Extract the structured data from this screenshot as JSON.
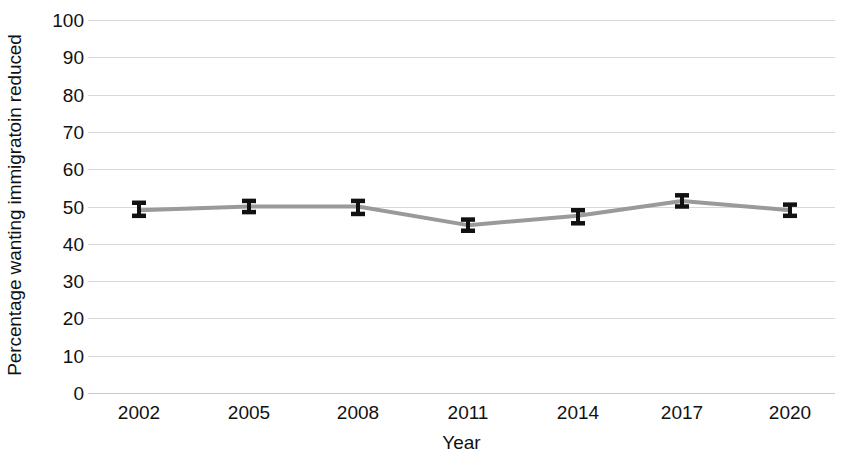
{
  "chart_data": {
    "type": "line",
    "title": "",
    "xlabel": "Year",
    "ylabel": "Percentage wanting immigratoin reduced",
    "categories": [
      "2002",
      "2005",
      "2008",
      "2011",
      "2014",
      "2017",
      "2020"
    ],
    "x": [
      2002,
      2005,
      2008,
      2011,
      2014,
      2017,
      2020
    ],
    "values": [
      49,
      50,
      50,
      45,
      47.5,
      51.5,
      49
    ],
    "errors_low": [
      47.5,
      48.5,
      48,
      43.5,
      45.5,
      50,
      47.5
    ],
    "errors_high": [
      51,
      51.5,
      51.5,
      46.5,
      49,
      53,
      50.5
    ],
    "ylim": [
      0,
      100
    ],
    "ytick_labels": [
      "100",
      "90",
      "80",
      "70",
      "60",
      "50",
      "40",
      "30",
      "20",
      "10",
      "0"
    ],
    "ytick_values": [
      100,
      90,
      80,
      70,
      60,
      50,
      40,
      30,
      20,
      10,
      0
    ],
    "grid": true,
    "legend": "none",
    "series": [
      {
        "name": "Percentage wanting immigration reduced",
        "values": [
          49,
          50,
          50,
          45,
          47.5,
          51.5,
          49
        ],
        "line_color": "#9a9a9a",
        "marker_color": "#111111"
      }
    ]
  },
  "colors": {
    "line": "#9a9a9a",
    "error_bar": "#111111",
    "gridline": "#d8d8d8",
    "background": "#ffffff",
    "text": "#111111"
  }
}
